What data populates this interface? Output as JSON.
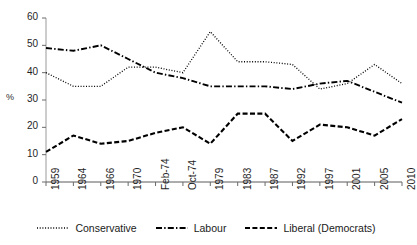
{
  "chart_data": {
    "type": "line",
    "title": "",
    "xlabel": "",
    "ylabel": "%",
    "ylim": [
      0,
      60
    ],
    "ytick_step": 10,
    "yticks": [
      "0",
      "10",
      "20",
      "30",
      "40",
      "50",
      "60"
    ],
    "grid": false,
    "legend_position": "bottom",
    "categories": [
      "1959",
      "1964",
      "1966",
      "1970",
      "Feb-74",
      "Oct-74",
      "1979",
      "1983",
      "1987",
      "1992",
      "1997",
      "2001",
      "2005",
      "2010"
    ],
    "series": [
      {
        "name": "Conservative",
        "line_style": "dotted",
        "color": "#000000",
        "values": [
          40,
          35,
          35,
          42,
          42,
          40,
          55,
          44,
          44,
          43,
          34,
          36,
          43,
          36
        ]
      },
      {
        "name": "Labour",
        "line_style": "dash-dot",
        "color": "#000000",
        "values": [
          49,
          48,
          50,
          45,
          40,
          38,
          35,
          35,
          35,
          34,
          36,
          37,
          33,
          29
        ]
      },
      {
        "name": "Liberal (Democrats)",
        "line_style": "dashed",
        "color": "#000000",
        "values": [
          11,
          17,
          14,
          15,
          18,
          20,
          14,
          25,
          25,
          15,
          21,
          20,
          17,
          23
        ]
      }
    ]
  },
  "legend": {
    "items": [
      {
        "label": "Conservative",
        "style": "dotted"
      },
      {
        "label": "Labour",
        "style": "dash-dot"
      },
      {
        "label": "Liberal (Democrats)",
        "style": "dashed"
      }
    ]
  }
}
